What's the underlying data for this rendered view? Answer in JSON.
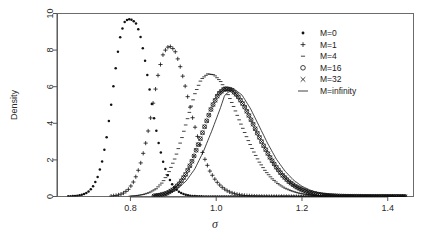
{
  "chart_data": {
    "type": "line",
    "title": "",
    "subtitle": "",
    "xlabel": "σ",
    "ylabel": "Density",
    "xlim": [
      0.63,
      1.46
    ],
    "ylim": [
      0,
      10
    ],
    "xticks": [
      0.8,
      1.0,
      1.2,
      1.4
    ],
    "xticklabels": [
      "0.8",
      "1.0",
      "1.2",
      "1.4"
    ],
    "yticks": [
      0,
      2,
      4,
      6,
      8,
      10
    ],
    "yticklabels": [
      "0",
      "2",
      "4",
      "6",
      "8",
      "10"
    ],
    "grid": false,
    "legend_position": "top-right",
    "marker_styles": [
      "dot",
      "plus",
      "dash",
      "circle",
      "cross",
      "line"
    ],
    "series": [
      {
        "name": "M=0",
        "marker": "dot",
        "peak_x": 0.81,
        "peak_y": 9.7,
        "x": [
          0.655,
          0.665,
          0.675,
          0.685,
          0.695,
          0.705,
          0.715,
          0.725,
          0.735,
          0.745,
          0.755,
          0.765,
          0.775,
          0.785,
          0.795,
          0.805,
          0.815,
          0.825,
          0.835,
          0.845,
          0.855,
          0.865,
          0.875,
          0.885,
          0.895,
          0.905,
          0.915,
          0.925,
          0.935,
          0.945,
          0.955,
          0.965,
          0.975,
          0.985,
          0.995,
          1.005,
          1.015,
          1.025,
          1.035,
          1.045,
          1.06,
          1.08,
          1.1,
          1.14,
          1.18,
          1.22,
          1.26,
          1.3,
          1.34,
          1.38,
          1.42,
          1.44
        ],
        "y": [
          0.01,
          0.02,
          0.04,
          0.08,
          0.16,
          0.32,
          0.62,
          1.15,
          2.0,
          3.3,
          5.0,
          6.9,
          8.6,
          9.5,
          9.7,
          9.65,
          9.4,
          8.6,
          7.3,
          5.8,
          4.3,
          3.0,
          2.0,
          1.25,
          0.75,
          0.42,
          0.23,
          0.12,
          0.06,
          0.03,
          0.015,
          0.008,
          0.004,
          0.002,
          0.001,
          0.001,
          0.0,
          0.0,
          0.0,
          0.0,
          0.0,
          0.0,
          0.0,
          0.0,
          0.0,
          0.0,
          0.0,
          0.0,
          0.0,
          0.0,
          0.0,
          0.0
        ]
      },
      {
        "name": "M=1",
        "marker": "plus",
        "peak_x": 0.91,
        "peak_y": 8.2,
        "x": [
          0.755,
          0.765,
          0.775,
          0.785,
          0.795,
          0.805,
          0.815,
          0.825,
          0.835,
          0.845,
          0.855,
          0.865,
          0.875,
          0.885,
          0.895,
          0.905,
          0.915,
          0.925,
          0.935,
          0.945,
          0.955,
          0.965,
          0.975,
          0.985,
          0.995,
          1.005,
          1.015,
          1.025,
          1.035,
          1.045,
          1.055,
          1.065,
          1.075,
          1.085,
          1.095,
          1.105,
          1.115,
          1.125,
          1.14,
          1.16,
          1.18,
          1.2,
          1.24,
          1.28,
          1.32,
          1.36,
          1.4,
          1.44
        ],
        "y": [
          0.02,
          0.05,
          0.1,
          0.2,
          0.38,
          0.7,
          1.2,
          1.9,
          2.85,
          4.0,
          5.4,
          6.7,
          7.7,
          8.15,
          8.2,
          7.9,
          7.2,
          6.3,
          5.3,
          4.3,
          3.4,
          2.6,
          1.95,
          1.4,
          1.0,
          0.7,
          0.48,
          0.32,
          0.21,
          0.14,
          0.09,
          0.06,
          0.04,
          0.025,
          0.015,
          0.01,
          0.006,
          0.004,
          0.002,
          0.001,
          0.0,
          0.0,
          0.0,
          0.0,
          0.0,
          0.0,
          0.0,
          0.0
        ]
      },
      {
        "name": "M=4",
        "marker": "dash",
        "peak_x": 0.985,
        "peak_y": 6.7,
        "x": [
          0.8,
          0.815,
          0.83,
          0.845,
          0.86,
          0.875,
          0.89,
          0.905,
          0.92,
          0.935,
          0.95,
          0.965,
          0.98,
          0.995,
          1.01,
          1.025,
          1.04,
          1.055,
          1.07,
          1.085,
          1.1,
          1.115,
          1.13,
          1.145,
          1.16,
          1.175,
          1.19,
          1.205,
          1.22,
          1.235,
          1.25,
          1.27,
          1.29,
          1.31,
          1.33,
          1.35,
          1.37,
          1.39,
          1.41,
          1.43,
          1.44
        ],
        "y": [
          0.02,
          0.05,
          0.11,
          0.22,
          0.42,
          0.78,
          1.35,
          2.15,
          3.2,
          4.4,
          5.6,
          6.4,
          6.7,
          6.65,
          6.3,
          5.7,
          4.95,
          4.1,
          3.3,
          2.55,
          1.9,
          1.38,
          0.98,
          0.68,
          0.46,
          0.31,
          0.2,
          0.13,
          0.085,
          0.055,
          0.035,
          0.018,
          0.01,
          0.005,
          0.003,
          0.002,
          0.001,
          0.0,
          0.0,
          0.0,
          0.0
        ]
      },
      {
        "name": "M=16",
        "marker": "circle",
        "peak_x": 1.02,
        "peak_y": 5.9,
        "x": [
          0.855,
          0.87,
          0.885,
          0.9,
          0.915,
          0.93,
          0.945,
          0.96,
          0.975,
          0.99,
          1.005,
          1.02,
          1.035,
          1.05,
          1.065,
          1.08,
          1.095,
          1.11,
          1.125,
          1.14,
          1.155,
          1.17,
          1.185,
          1.2,
          1.215,
          1.23,
          1.245,
          1.26,
          1.28,
          1.3,
          1.32,
          1.34,
          1.36,
          1.38,
          1.4,
          1.42,
          1.44
        ],
        "y": [
          0.03,
          0.08,
          0.18,
          0.38,
          0.72,
          1.25,
          2.0,
          2.95,
          3.95,
          4.9,
          5.6,
          5.9,
          5.85,
          5.5,
          4.95,
          4.25,
          3.5,
          2.8,
          2.15,
          1.6,
          1.15,
          0.8,
          0.55,
          0.37,
          0.24,
          0.15,
          0.095,
          0.06,
          0.03,
          0.015,
          0.008,
          0.004,
          0.002,
          0.001,
          0.001,
          0.0,
          0.0
        ]
      },
      {
        "name": "M=32",
        "marker": "cross",
        "peak_x": 1.02,
        "peak_y": 5.9,
        "x": [
          0.855,
          0.87,
          0.885,
          0.9,
          0.915,
          0.93,
          0.945,
          0.96,
          0.975,
          0.99,
          1.005,
          1.02,
          1.035,
          1.05,
          1.065,
          1.08,
          1.095,
          1.11,
          1.125,
          1.14,
          1.155,
          1.17,
          1.185,
          1.2,
          1.215,
          1.23,
          1.245,
          1.26,
          1.28,
          1.3,
          1.32,
          1.34,
          1.36,
          1.38,
          1.4,
          1.42,
          1.44
        ],
        "y": [
          0.03,
          0.08,
          0.18,
          0.38,
          0.72,
          1.25,
          2.0,
          2.95,
          3.95,
          4.9,
          5.6,
          5.9,
          5.85,
          5.5,
          4.95,
          4.25,
          3.5,
          2.8,
          2.15,
          1.6,
          1.15,
          0.8,
          0.55,
          0.37,
          0.24,
          0.15,
          0.095,
          0.06,
          0.03,
          0.015,
          0.008,
          0.004,
          0.002,
          0.001,
          0.001,
          0.0,
          0.0
        ]
      },
      {
        "name": "M=infinity",
        "marker": "line",
        "peak_x": 1.02,
        "peak_y": 5.9,
        "x": [
          0.85,
          0.87,
          0.89,
          0.91,
          0.93,
          0.95,
          0.97,
          0.99,
          1.01,
          1.02,
          1.04,
          1.06,
          1.08,
          1.1,
          1.12,
          1.14,
          1.16,
          1.18,
          1.2,
          1.22,
          1.24,
          1.26,
          1.28,
          1.3,
          1.32,
          1.34,
          1.36,
          1.38,
          1.4,
          1.42,
          1.44
        ],
        "y": [
          0.025,
          0.075,
          0.19,
          0.42,
          0.85,
          1.5,
          2.45,
          3.6,
          4.85,
          5.55,
          5.9,
          5.55,
          4.8,
          3.85,
          2.9,
          2.05,
          1.4,
          0.9,
          0.56,
          0.34,
          0.2,
          0.11,
          0.06,
          0.03,
          0.015,
          0.007,
          0.004,
          0.002,
          0.001,
          0.0,
          0.0
        ]
      }
    ]
  },
  "legend": {
    "entries": [
      {
        "label": "M=0",
        "marker": "dot"
      },
      {
        "label": "M=1",
        "marker": "plus"
      },
      {
        "label": "M=4",
        "marker": "dash"
      },
      {
        "label": "M=16",
        "marker": "circle"
      },
      {
        "label": "M=32",
        "marker": "cross"
      },
      {
        "label": "M=infinity",
        "marker": "line"
      }
    ]
  },
  "colors": {
    "ink": "#111111",
    "axis": "#555555",
    "box": "#6b6b6b",
    "background": "#ffffff"
  }
}
